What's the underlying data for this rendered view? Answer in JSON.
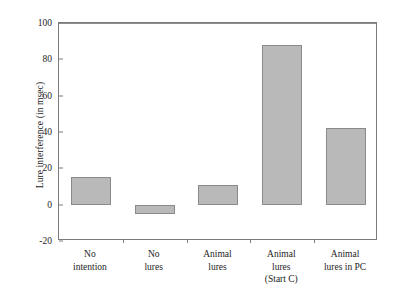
{
  "chart_data": {
    "type": "bar",
    "title": "",
    "xlabel": "",
    "ylabel": "Lure interference (in msec)",
    "categories": [
      "No\nintention",
      "No\nlures",
      "Animal\nlures",
      "Animal\nlures\n(Start C)",
      "Animal\nlures in PC"
    ],
    "category_lines": [
      [
        "No",
        "intention"
      ],
      [
        "No",
        "lures"
      ],
      [
        "Animal",
        "lures"
      ],
      [
        "Animal",
        "lures",
        "(Start C)"
      ],
      [
        "Animal",
        "lures in PC"
      ]
    ],
    "values": [
      15,
      -5,
      11,
      88,
      42
    ],
    "ylim": [
      -20,
      100
    ],
    "yticks": [
      100,
      80,
      60,
      40,
      20,
      0,
      -20
    ],
    "ytick_labels": [
      "100",
      "80",
      "60",
      "40",
      "20",
      "0",
      "-20"
    ],
    "grid": false,
    "legend": null,
    "bar_fill_color": "#b9b9b9",
    "bar_edge_color": "#8a8a8a",
    "axis_color": "#7b7b7b",
    "background_color": "#ffffff"
  }
}
